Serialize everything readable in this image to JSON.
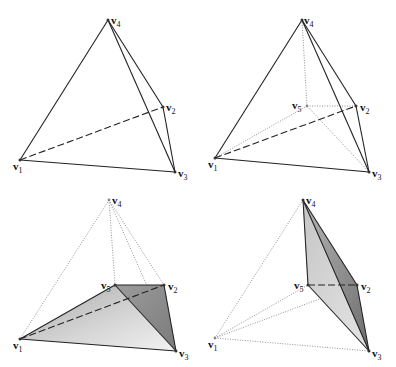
{
  "figure": {
    "colors": {
      "line": "#222222",
      "dotted": "#777777",
      "shade_light": "#d9d9d9",
      "shade_dark": "#9a9a9a"
    },
    "panels": [
      {
        "id": "top-left",
        "labels": {
          "v4": "v",
          "v4_sub": "4",
          "v2": "v",
          "v2_sub": "2",
          "v1": "v",
          "v1_sub": "1",
          "v3": "v",
          "v3_sub": "3"
        }
      },
      {
        "id": "top-right",
        "labels": {
          "v4": "v",
          "v4_sub": "4",
          "v5": "v",
          "v5_sub": "5",
          "v2": "v",
          "v2_sub": "2",
          "v1": "v",
          "v1_sub": "1",
          "v3": "v",
          "v3_sub": "3"
        }
      },
      {
        "id": "bottom-left",
        "labels": {
          "v4": "v",
          "v4_sub": "4",
          "v5": "v",
          "v5_sub": "5",
          "v2": "v",
          "v2_sub": "2",
          "v1": "v",
          "v1_sub": "1",
          "v3": "v",
          "v3_sub": "3"
        }
      },
      {
        "id": "bottom-right",
        "labels": {
          "v4": "v",
          "v4_sub": "4",
          "v5": "v",
          "v5_sub": "5",
          "v2": "v",
          "v2_sub": "2",
          "v1": "v",
          "v1_sub": "1",
          "v3": "v",
          "v3_sub": "3"
        }
      }
    ]
  }
}
